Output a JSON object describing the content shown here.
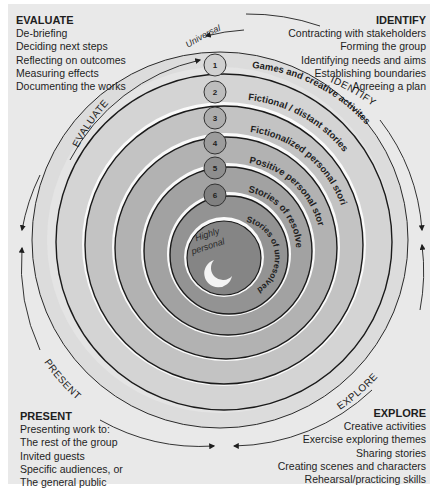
{
  "phases": {
    "evaluate": {
      "title": "EVALUATE",
      "items": [
        "De-briefing",
        "Deciding next steps",
        "Reflecting on outcomes",
        "Measuring effects",
        "Documenting the works"
      ],
      "arc_label": "EVALUATE"
    },
    "identify": {
      "title": "IDENTIFY",
      "items": [
        "Contracting with stakeholders",
        "Forming the group",
        "Identifying needs and aims",
        "Establishing boundaries",
        "Agreeing a plan"
      ],
      "arc_label": "IDENTIFY"
    },
    "present": {
      "title": "PRESENT",
      "items": [
        "Presenting work to:",
        "The rest of the group",
        "Invited guests",
        "Specific audiences, or",
        "The general public"
      ],
      "arc_label": "PRESENT"
    },
    "explore": {
      "title": "EXPLORE",
      "items": [
        "Creative activities",
        "Exercise exploring themes",
        "Sharing stories",
        "Creating scenes and characters",
        "Rehearsal/practicing skills"
      ],
      "arc_label": "EXPLORE"
    }
  },
  "spiral": {
    "outer_label": "Universal",
    "inner_label_line1": "Highly",
    "inner_label_line2": "personal",
    "levels": [
      {
        "number": "1",
        "label": "Games and creative activites",
        "color": "#d6d6d6"
      },
      {
        "number": "2",
        "label": "Fictional / distant stories",
        "color": "#c4c4c4"
      },
      {
        "number": "3",
        "label": "Fictionalized personal stories",
        "color": "#b3b3b3"
      },
      {
        "number": "4",
        "label": "Positive personal stories",
        "color": "#a3a3a3"
      },
      {
        "number": "5",
        "label": "Stories of resolved difficulties",
        "color": "#949494"
      },
      {
        "number": "6",
        "label": "Stories of unresolved difficulties",
        "color": "#868686"
      }
    ]
  }
}
